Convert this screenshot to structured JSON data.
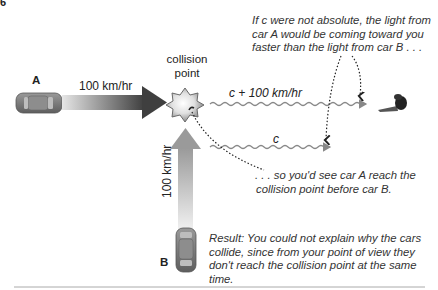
{
  "figure": {
    "corner_mark": "6",
    "collision_label_line1": "collision",
    "collision_label_line2": "point",
    "car_a": {
      "label": "A",
      "speed": "100 km/hr"
    },
    "car_b": {
      "label": "B",
      "speed": "100 km/hr"
    },
    "light_a": {
      "label": "c + 100 km/hr"
    },
    "light_b": {
      "label": "c"
    },
    "annotation_top": [
      "If c were not absolute, the light from",
      "car A would be coming toward you",
      "faster than the light from car B . . ."
    ],
    "annotation_middle": [
      ". . . so you'd see car A reach the",
      "collision point before car B."
    ],
    "result": [
      "Result: You could not explain why the cars",
      "collide, since from your point of view they",
      "don't reach the collision point at the same time."
    ],
    "colors": {
      "arrow_a_dark": "#4a4a4a",
      "arrow_b_light": "#9a9a9a",
      "wave": "#888888",
      "car_body": "#777777"
    }
  }
}
